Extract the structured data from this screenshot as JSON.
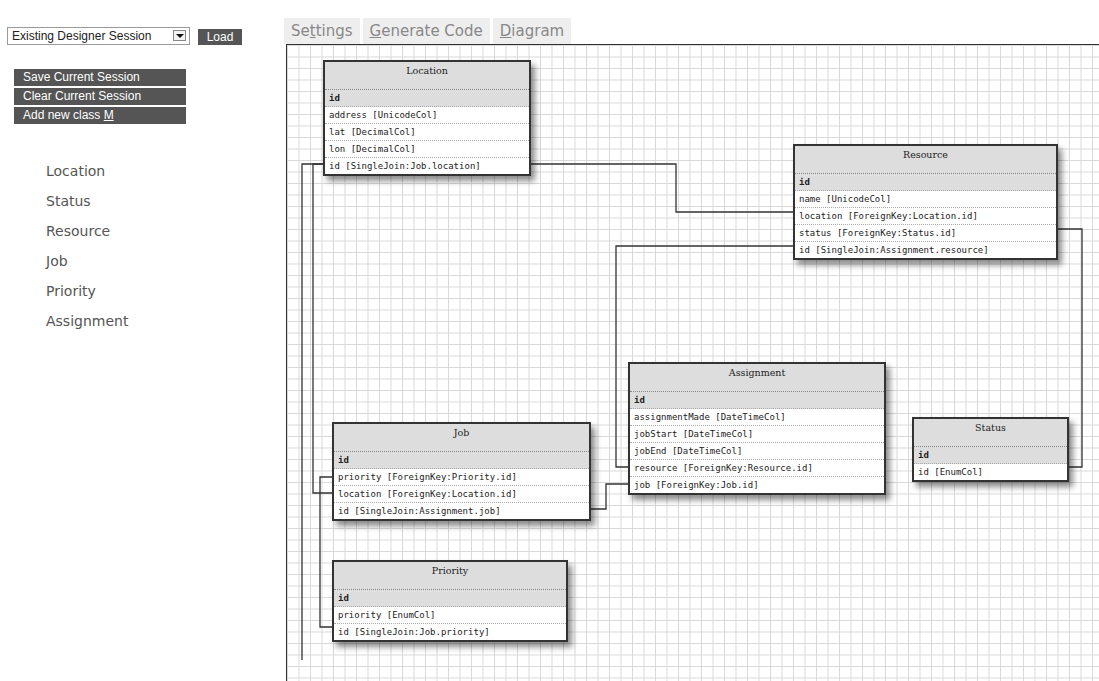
{
  "sidebar": {
    "session_select": {
      "value": "Existing Designer Session"
    },
    "load_label": "Load",
    "buttons": [
      {
        "label": "Save Current Session"
      },
      {
        "label": "Clear Current Session"
      },
      {
        "label_prefix": "Add new class ",
        "label_accesskey": "M"
      }
    ],
    "classes": [
      "Location",
      "Status",
      "Resource",
      "Job",
      "Priority",
      "Assignment"
    ]
  },
  "tabs": [
    {
      "pre": "Se",
      "key": "t",
      "post": "tings"
    },
    {
      "pre": "",
      "key": "G",
      "post": "enerate Code"
    },
    {
      "pre": "",
      "key": "D",
      "post": "iagram"
    }
  ],
  "diagram": {
    "tables": {
      "location": {
        "title": "Location",
        "rows": [
          "id",
          "address [UnicodeCol]",
          "lat [DecimalCol]",
          "lon [DecimalCol]",
          "id [SingleJoin:Job.location]"
        ]
      },
      "resource": {
        "title": "Resource",
        "rows": [
          "id",
          "name [UnicodeCol]",
          "location [ForeignKey:Location.id]",
          "status [ForeignKey:Status.id]",
          "id [SingleJoin:Assignment.resource]"
        ]
      },
      "assignment": {
        "title": "Assignment",
        "rows": [
          "id",
          "assignmentMade [DateTimeCol]",
          "jobStart [DateTimeCol]",
          "jobEnd [DateTimeCol]",
          "resource [ForeignKey:Resource.id]",
          "job [ForeignKey:Job.id]"
        ]
      },
      "job": {
        "title": "Job",
        "rows": [
          "id",
          "priority [ForeignKey:Priority.id]",
          "location [ForeignKey:Location.id]",
          "id [SingleJoin:Assignment.job]"
        ]
      },
      "status": {
        "title": "Status",
        "rows": [
          "id",
          "id [EnumCol]"
        ]
      },
      "priority": {
        "title": "Priority",
        "rows": [
          "id",
          "priority [EnumCol]",
          "id [SingleJoin:Job.priority]"
        ]
      }
    }
  }
}
